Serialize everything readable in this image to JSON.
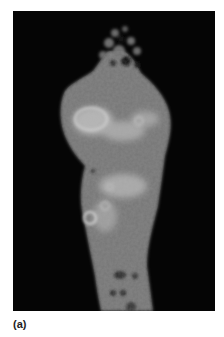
{
  "figure": {
    "panel_label": "(a)",
    "image_description": "grayscale fluorescence/tomographic micrograph of elongated specimen on black background",
    "colors": {
      "background": "#050505",
      "specimen_base": "#7a7a7a",
      "specimen_bright": "#c8c8c8",
      "page": "#ffffff"
    }
  }
}
